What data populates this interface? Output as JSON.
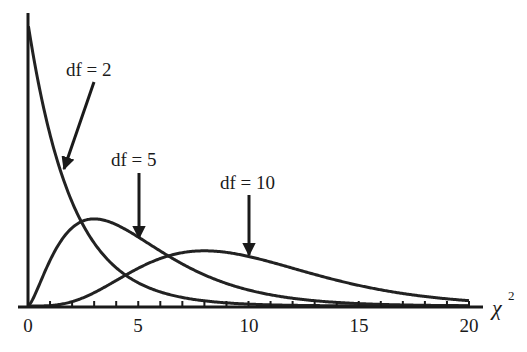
{
  "chart_data": {
    "type": "line",
    "title": "",
    "xlabel": "χ",
    "xlabel_superscript": "2",
    "ylabel": "",
    "xlim": [
      0,
      20
    ],
    "ylim": [
      0,
      0.55
    ],
    "grid": false,
    "x_ticks": [
      0,
      5,
      10,
      15,
      20
    ],
    "x_tick_labels": [
      "0",
      "5",
      "10",
      "15",
      "20"
    ],
    "minor_tick_step": 1,
    "series": [
      {
        "name": "df = 2",
        "df": 2,
        "distribution": "chi-square pdf",
        "x": [
          0,
          1,
          2,
          3,
          4,
          5,
          6,
          8,
          10,
          15,
          20
        ],
        "values": [
          0.5,
          0.303,
          0.184,
          0.112,
          0.068,
          0.041,
          0.025,
          0.009,
          0.003,
          0.0003,
          2e-05
        ]
      },
      {
        "name": "df = 5",
        "df": 5,
        "distribution": "chi-square pdf",
        "x": [
          0,
          1,
          2,
          3,
          4,
          5,
          6,
          8,
          10,
          15,
          20
        ],
        "values": [
          0,
          0.08,
          0.138,
          0.154,
          0.144,
          0.122,
          0.097,
          0.055,
          0.028,
          0.004,
          0.0005
        ]
      },
      {
        "name": "df = 10",
        "df": 10,
        "distribution": "chi-square pdf",
        "x": [
          0,
          2,
          4,
          6,
          8,
          10,
          12,
          14,
          16,
          18,
          20
        ],
        "values": [
          0,
          0.008,
          0.045,
          0.084,
          0.098,
          0.088,
          0.067,
          0.046,
          0.029,
          0.017,
          0.009
        ]
      }
    ],
    "annotations": [
      {
        "text": "df = 2",
        "arrow_points_to_x": 1.6
      },
      {
        "text": "df = 5",
        "arrow_points_to_x": 5
      },
      {
        "text": "df = 10",
        "arrow_points_to_x": 10
      }
    ]
  },
  "labels": {
    "tick_0": "0",
    "tick_5": "5",
    "tick_10": "10",
    "tick_15": "15",
    "tick_20": "20",
    "axis_var": "χ",
    "axis_sup": "2",
    "annot_df2": "df = 2",
    "annot_df5": "df = 5",
    "annot_df10": "df = 10"
  },
  "colors": {
    "curve": "#222222",
    "axis": "#1a1a1a",
    "background": "#ffffff"
  }
}
